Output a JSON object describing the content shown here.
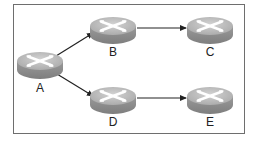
{
  "diagram": {
    "type": "network-topology",
    "colors": {
      "frame": "#6e6e6e",
      "router_top": "#b8b8b8",
      "router_top_highlight": "#cfcfcf",
      "router_side": "#8e8e8e",
      "router_mark": "#ffffff",
      "arrow": "#222222",
      "label": "#222222"
    },
    "nodes": [
      {
        "id": "A",
        "label": "A",
        "kind": "router"
      },
      {
        "id": "B",
        "label": "B",
        "kind": "router"
      },
      {
        "id": "C",
        "label": "C",
        "kind": "router"
      },
      {
        "id": "D",
        "label": "D",
        "kind": "router"
      },
      {
        "id": "E",
        "label": "E",
        "kind": "router"
      }
    ],
    "edges": [
      {
        "from": "A",
        "to": "B",
        "directed": true
      },
      {
        "from": "B",
        "to": "C",
        "directed": true
      },
      {
        "from": "A",
        "to": "D",
        "directed": true
      },
      {
        "from": "D",
        "to": "E",
        "directed": true
      }
    ]
  }
}
